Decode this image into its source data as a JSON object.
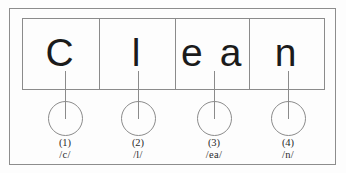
{
  "worksheet": {
    "word": "Clean",
    "title": "Clean phoneme segmentation box",
    "background_color": "#fdfdfd",
    "line_color": "#8b8b8b",
    "text_color": "#1b1b1b"
  },
  "boxes": [
    {
      "grapheme": "C",
      "number": "(1)",
      "phoneme": "/c/"
    },
    {
      "grapheme": "l",
      "number": "(2)",
      "phoneme": "/l/"
    },
    {
      "grapheme": "e a",
      "number": "(3)",
      "phoneme": "/ea/"
    },
    {
      "grapheme": "n",
      "number": "(4)",
      "phoneme": "/n/"
    }
  ]
}
